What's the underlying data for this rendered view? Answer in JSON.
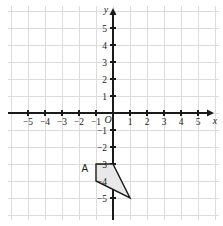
{
  "chart_data": {
    "type": "scatter",
    "title": "",
    "xlabel": "x",
    "ylabel": "y",
    "xlim": [
      -6,
      6
    ],
    "ylim": [
      -6,
      6
    ],
    "grid": true,
    "grid_step": 1,
    "origin_label": "O",
    "legend": "none",
    "x_ticks": [
      -5,
      -4,
      -3,
      -2,
      -1,
      1,
      2,
      3,
      4,
      5
    ],
    "y_ticks": [
      5,
      4,
      3,
      2,
      1,
      -1,
      -2,
      -3,
      -4,
      -5
    ],
    "x_tick_labels": [
      "−5",
      "−4",
      "−3",
      "−2",
      "−1",
      "1",
      "2",
      "3",
      "4",
      "5"
    ],
    "y_tick_labels": [
      "5",
      "4",
      "3",
      "2",
      "1",
      "−1",
      "−2",
      "−3",
      "−4",
      "−5"
    ],
    "shapes": [
      {
        "name": "A",
        "label": "A",
        "type": "polygon",
        "vertices": [
          [
            -1,
            -3
          ],
          [
            0,
            -3
          ],
          [
            1,
            -5
          ],
          [
            -1,
            -4
          ]
        ],
        "fill": "#e8e8e8",
        "stroke": "#1a1a1a",
        "label_position": [
          -1.65,
          -3.45
        ]
      }
    ],
    "colors": {
      "axis": "#1a1a1a",
      "grid": "#dcdcdc",
      "background": "#ffffff",
      "shape_fill": "#e8e8e8",
      "shape_stroke": "#1a1a1a",
      "text": "#1a1a1a"
    }
  },
  "plot": {
    "x_axis_name": "x",
    "y_axis_name": "y",
    "origin": "O"
  }
}
